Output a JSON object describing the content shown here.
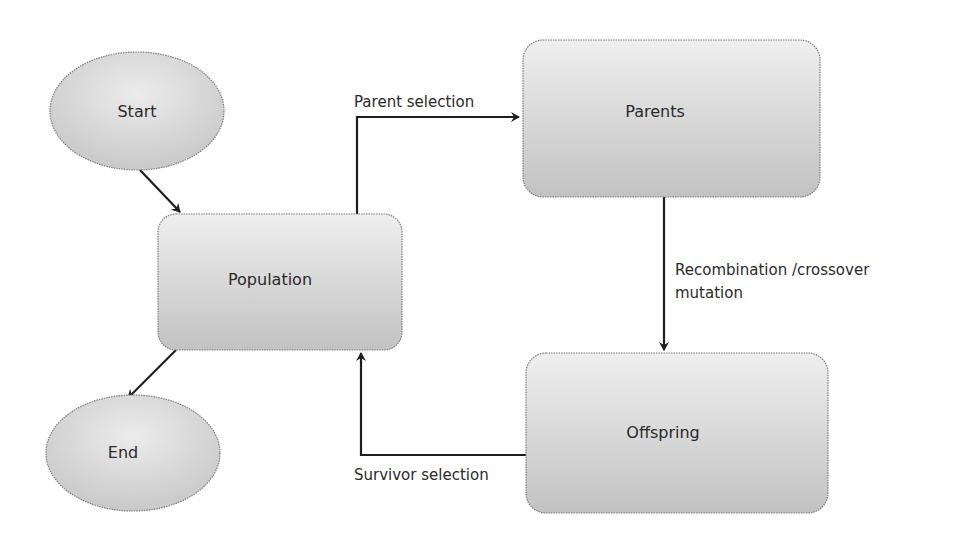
{
  "diagram": {
    "nodes": {
      "start": {
        "label": "Start",
        "shape": "ellipse"
      },
      "population": {
        "label": "Population",
        "shape": "rounded-rectangle"
      },
      "parents": {
        "label": "Parents",
        "shape": "rounded-rectangle"
      },
      "offspring": {
        "label": "Offspring",
        "shape": "rounded-rectangle"
      },
      "end": {
        "label": "End",
        "shape": "ellipse"
      }
    },
    "edges": {
      "start_to_population": {
        "from": "Start",
        "to": "Population",
        "label": ""
      },
      "population_to_parents": {
        "from": "Population",
        "to": "Parents",
        "label": "Parent selection"
      },
      "parents_to_offspring": {
        "from": "Parents",
        "to": "Offspring",
        "label_line1": "Recombination /crossover",
        "label_line2": "mutation"
      },
      "offspring_to_population": {
        "from": "Offspring",
        "to": "Population",
        "label": "Survivor selection"
      },
      "population_to_end": {
        "from": "Population",
        "to": "End",
        "label": ""
      }
    },
    "colors": {
      "fill_light": "#eeeeee",
      "fill_dark": "#c4c4c4",
      "stroke": "#7a7a7a",
      "edge": "#1e1e1e",
      "text": "#2a2a2a"
    }
  }
}
